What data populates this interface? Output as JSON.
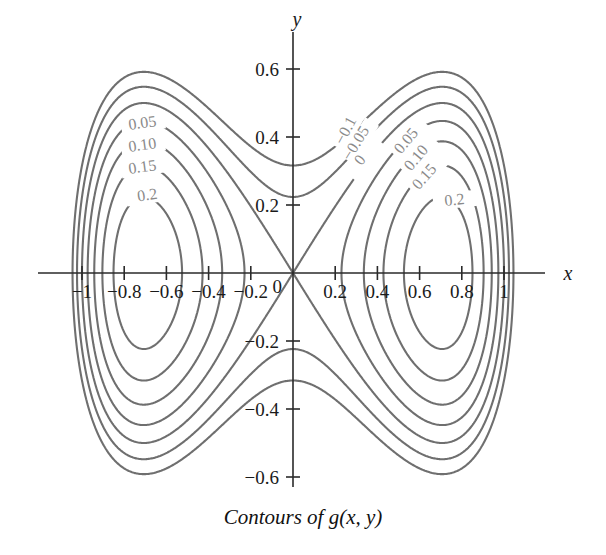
{
  "chart_data": {
    "type": "line",
    "title": "Contours of g(x, y)",
    "xlabel": "x",
    "ylabel": "y",
    "xlim": [
      -1.25,
      1.25
    ],
    "ylim": [
      -0.75,
      0.75
    ],
    "grid": false,
    "legend": "none",
    "levels": [
      -0.1,
      -0.05,
      0,
      0.05,
      0.1,
      0.15,
      0.2
    ],
    "centers": [
      [
        -0.72,
        0
      ],
      [
        0.72,
        0
      ]
    ],
    "saddle": [
      0,
      0
    ],
    "xticks": [
      -1,
      -0.8,
      -0.6,
      -0.4,
      -0.2,
      0,
      0.2,
      0.4,
      0.6,
      0.8,
      1
    ],
    "xticklabels": [
      "−1",
      "−0.8",
      "−0.6",
      "−0.4",
      "−0.2",
      "0",
      "0.2",
      "0.4",
      "0.6",
      "0.8",
      "1"
    ],
    "yticks": [
      -0.6,
      -0.4,
      -0.2,
      0.2,
      0.4,
      0.6
    ],
    "yticklabels": [
      "−0.6",
      "−0.4",
      "−0.2",
      "0.2",
      "0.4",
      "0.6"
    ],
    "contour_labels_left": [
      {
        "text": "0.05",
        "level": 0.05
      },
      {
        "text": "0.10",
        "level": 0.1
      },
      {
        "text": "0.15",
        "level": 0.15
      },
      {
        "text": "0.2",
        "level": 0.2
      }
    ],
    "contour_labels_center": [
      {
        "text": "−0.1",
        "level": -0.1
      },
      {
        "text": "−0.05",
        "level": -0.05
      },
      {
        "text": "0",
        "level": 0
      }
    ],
    "contour_labels_right": [
      {
        "text": "0.05",
        "level": 0.05
      },
      {
        "text": "0.10",
        "level": 0.1
      },
      {
        "text": "0.15",
        "level": 0.15
      },
      {
        "text": "0.2",
        "level": 0.2
      }
    ],
    "colors": {
      "contour": "#6f6f6f",
      "axis": "#2a2a2a",
      "tick_label": "#1a1a1a",
      "contour_label": "#8a8a8a",
      "background": "#ffffff"
    }
  },
  "caption": {
    "text": "Contours of g(x, y)"
  },
  "axes": {
    "x_name": "x",
    "y_name": "y"
  }
}
